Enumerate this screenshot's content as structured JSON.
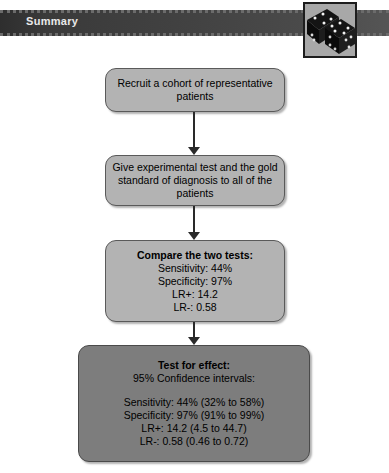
{
  "header": {
    "title": "Summary",
    "bar_color": "#414141",
    "text_color": "#e9e9e9"
  },
  "figure": {
    "name": "dice-image",
    "alt": "Two black dice with white pips",
    "background_color": "#a8a8a8",
    "border_color": "#1d1d1d"
  },
  "flowchart": {
    "box_fill": "#b3b3b3",
    "box_fill_dark": "#7d7d7d",
    "box_border": "#5a5a5a",
    "boxes": [
      {
        "id": "recruit",
        "lines": [
          "Recruit a cohort of representative",
          "patients"
        ]
      },
      {
        "id": "give-test",
        "lines": [
          "Give experimental test and the gold",
          "standard of diagnosis to all of the",
          "patients"
        ]
      },
      {
        "id": "compare",
        "heading": "Compare the two tests:",
        "lines": [
          "Sensitivity: 44%",
          "Specificity: 97%",
          "LR+: 14.2",
          "LR-: 0.58"
        ]
      },
      {
        "id": "effect",
        "heading": "Test for effect:",
        "subheading": "95% Confidence intervals:",
        "lines": [
          "Sensitivity: 44% (32% to 58%)",
          "Specificity: 97% (91% to 99%)",
          "LR+:  14.2 (4.5 to 44.7)",
          "LR-: 0.58 (0.46 to 0.72)"
        ]
      }
    ]
  }
}
